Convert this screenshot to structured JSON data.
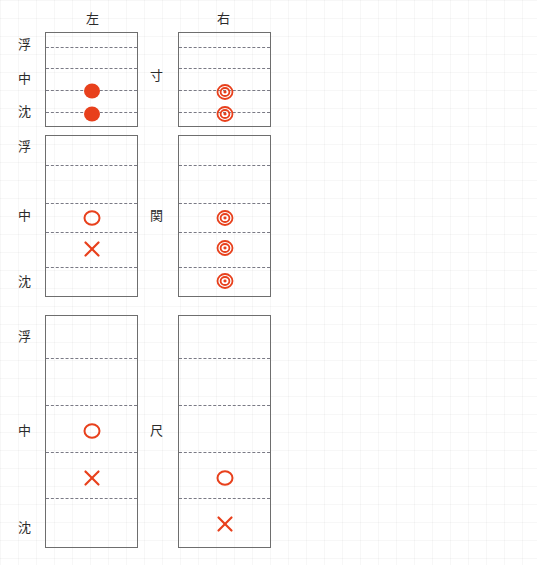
{
  "figure": {
    "title": "",
    "accent_color": "#e8401c",
    "frame_color": "#6e6e6e",
    "gridline_color": "#7a7a85",
    "text_color": "#2b2b2b"
  },
  "columns": [
    {
      "key": "left",
      "label": "左"
    },
    {
      "key": "right",
      "label": "右"
    }
  ],
  "depth_levels": [
    {
      "key": "fu",
      "label": "浮"
    },
    {
      "key": "chu",
      "label": "中"
    },
    {
      "key": "chin",
      "label": "沈"
    }
  ],
  "positions": [
    {
      "key": "sun",
      "label": "寸"
    },
    {
      "key": "kan",
      "label": "関"
    },
    {
      "key": "shaku",
      "label": "尺"
    }
  ],
  "marker_glyphs": {
    "filled-circle": "●",
    "double-circle": "◎",
    "open-circle": "○",
    "cross": "×"
  },
  "chart_data": {
    "type": "scatter",
    "title": "",
    "xlabel": "",
    "ylabel": "",
    "grid": true,
    "legend": "none",
    "x_categories": [
      "左",
      "右"
    ],
    "y_categories": [
      "浮",
      "中",
      "沈"
    ],
    "row_labels": [
      "寸",
      "関",
      "尺"
    ],
    "panels": [
      {
        "row": "寸",
        "column": "左",
        "gridline_count": 4,
        "markers": [
          {
            "type": "filled-circle",
            "depth": "中-沈",
            "y_frac": 0.61
          },
          {
            "type": "filled-circle",
            "depth": "沈",
            "y_frac": 0.85
          }
        ]
      },
      {
        "row": "寸",
        "column": "右",
        "gridline_count": 4,
        "markers": [
          {
            "type": "double-circle",
            "depth": "中-沈",
            "y_frac": 0.63
          },
          {
            "type": "double-circle",
            "depth": "沈",
            "y_frac": 0.85
          }
        ]
      },
      {
        "row": "関",
        "column": "左",
        "gridline_count": 4,
        "markers": [
          {
            "type": "open-circle",
            "depth": "中",
            "y_frac": 0.5
          },
          {
            "type": "cross",
            "depth": "中-沈",
            "y_frac": 0.69
          }
        ]
      },
      {
        "row": "関",
        "column": "右",
        "gridline_count": 4,
        "markers": [
          {
            "type": "double-circle",
            "depth": "中",
            "y_frac": 0.5
          },
          {
            "type": "double-circle",
            "depth": "中-沈",
            "y_frac": 0.69
          },
          {
            "type": "double-circle",
            "depth": "沈",
            "y_frac": 0.88
          }
        ]
      },
      {
        "row": "尺",
        "column": "左",
        "gridline_count": 4,
        "markers": [
          {
            "type": "open-circle",
            "depth": "中",
            "y_frac": 0.5
          },
          {
            "type": "cross",
            "depth": "中-沈",
            "y_frac": 0.7
          }
        ]
      },
      {
        "row": "尺",
        "column": "右",
        "gridline_count": 4,
        "markers": [
          {
            "type": "open-circle",
            "depth": "中-沈",
            "y_frac": 0.7
          },
          {
            "type": "cross",
            "depth": "沈",
            "y_frac": 0.9
          }
        ]
      }
    ]
  },
  "layout": {
    "headers": [
      {
        "name": "左",
        "x": 92,
        "y": 12
      },
      {
        "name": "右",
        "x": 223,
        "y": 12
      }
    ],
    "panel_boxes": [
      {
        "row": 0,
        "col": 0,
        "x": 45,
        "y": 32,
        "w": 93,
        "h": 95,
        "gridlines": [
          47,
          68,
          90,
          112
        ]
      },
      {
        "row": 0,
        "col": 1,
        "x": 178,
        "y": 32,
        "w": 93,
        "h": 95,
        "gridlines": [
          47,
          68,
          90,
          112
        ]
      },
      {
        "row": 1,
        "col": 0,
        "x": 45,
        "y": 135,
        "w": 93,
        "h": 162,
        "gridlines": [
          165,
          203,
          232,
          267
        ]
      },
      {
        "row": 1,
        "col": 1,
        "x": 178,
        "y": 135,
        "w": 93,
        "h": 162,
        "gridlines": [
          165,
          203,
          232,
          267
        ]
      },
      {
        "row": 2,
        "col": 0,
        "x": 45,
        "y": 315,
        "w": 93,
        "h": 233,
        "gridlines": [
          358,
          405,
          452,
          498
        ]
      },
      {
        "row": 2,
        "col": 1,
        "x": 178,
        "y": 315,
        "w": 93,
        "h": 233,
        "gridlines": [
          358,
          405,
          452,
          498
        ]
      }
    ],
    "depth_label_positions": [
      {
        "label": "浮",
        "x": 24,
        "y": 38
      },
      {
        "label": "中",
        "x": 24,
        "y": 72
      },
      {
        "label": "沈",
        "x": 24,
        "y": 105
      },
      {
        "label": "浮",
        "x": 24,
        "y": 140
      },
      {
        "label": "中",
        "x": 24,
        "y": 209
      },
      {
        "label": "沈",
        "x": 24,
        "y": 275
      },
      {
        "label": "浮",
        "x": 24,
        "y": 330
      },
      {
        "label": "中",
        "x": 24,
        "y": 424
      },
      {
        "label": "沈",
        "x": 24,
        "y": 521
      }
    ],
    "group_label_positions": [
      {
        "label": "寸",
        "x": 156,
        "y": 69
      },
      {
        "label": "関",
        "x": 156,
        "y": 209
      },
      {
        "label": "尺",
        "x": 156,
        "y": 424
      }
    ],
    "marker_points": [
      {
        "panel": 0,
        "type": "filled-circle",
        "cx": 92,
        "cy": 91
      },
      {
        "panel": 0,
        "type": "filled-circle",
        "cx": 92,
        "cy": 114
      },
      {
        "panel": 1,
        "type": "double-circle",
        "cx": 225,
        "cy": 92
      },
      {
        "panel": 1,
        "type": "double-circle",
        "cx": 225,
        "cy": 114
      },
      {
        "panel": 2,
        "type": "open-circle",
        "cx": 92,
        "cy": 218
      },
      {
        "panel": 2,
        "type": "cross",
        "cx": 92,
        "cy": 249
      },
      {
        "panel": 3,
        "type": "double-circle",
        "cx": 225,
        "cy": 218
      },
      {
        "panel": 3,
        "type": "double-circle",
        "cx": 225,
        "cy": 248
      },
      {
        "panel": 3,
        "type": "double-circle",
        "cx": 225,
        "cy": 281
      },
      {
        "panel": 4,
        "type": "open-circle",
        "cx": 92,
        "cy": 431
      },
      {
        "panel": 4,
        "type": "cross",
        "cx": 92,
        "cy": 478
      },
      {
        "panel": 5,
        "type": "open-circle",
        "cx": 225,
        "cy": 478
      },
      {
        "panel": 5,
        "type": "cross",
        "cx": 225,
        "cy": 524
      }
    ]
  }
}
